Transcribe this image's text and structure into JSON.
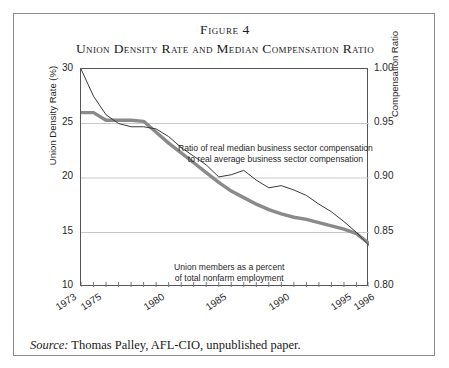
{
  "figure": {
    "number": "Figure 4",
    "title": "Union Density Rate and Median Compensation Ratio"
  },
  "source": {
    "label": "Source:",
    "text": " Thomas Palley, AFL-CIO, unpublished paper."
  },
  "chart_data": {
    "type": "line",
    "title": "Union Density Rate and Median Compensation Ratio",
    "xlabel": "",
    "ylabel": "Union Density Rate (%)",
    "y2label": "Compensation Ratio",
    "xlim": [
      1973,
      1996
    ],
    "ylim": [
      10,
      30
    ],
    "y2lim": [
      0.8,
      1.0
    ],
    "grid": true,
    "grid_axis": "y",
    "legend": "none",
    "x_ticks_major": [
      "1973",
      "1975",
      "1980",
      "1985",
      "1990",
      "1995",
      "1996"
    ],
    "x_ticks_major_values": [
      1973,
      1975,
      1980,
      1985,
      1990,
      1995,
      1996
    ],
    "x_ticks_minor_step": 1,
    "y_ticks": [
      "10",
      "15",
      "20",
      "25",
      "30"
    ],
    "y_tick_values": [
      10,
      15,
      20,
      25,
      30
    ],
    "y2_ticks": [
      "0.80",
      "0.85",
      "0.90",
      "0.95",
      "1.00"
    ],
    "y2_tick_values": [
      0.8,
      0.85,
      0.9,
      0.95,
      1.0
    ],
    "x": [
      1973,
      1974,
      1975,
      1976,
      1977,
      1978,
      1979,
      1980,
      1981,
      1982,
      1983,
      1984,
      1985,
      1986,
      1987,
      1988,
      1989,
      1990,
      1991,
      1992,
      1993,
      1994,
      1995,
      1996
    ],
    "series": [
      {
        "name": "Union members as a percent of total nonfarm employment",
        "axis": "left",
        "units": "percent",
        "color": "#8a8a8a",
        "line_width": 3.4,
        "annotation": "Union members as a percent\nof total nonfarm employment",
        "values": [
          26.0,
          26.0,
          25.3,
          25.3,
          25.3,
          25.2,
          24.2,
          23.2,
          22.3,
          21.4,
          20.5,
          19.6,
          18.8,
          18.2,
          17.6,
          17.1,
          16.7,
          16.4,
          16.2,
          15.9,
          15.6,
          15.3,
          14.9,
          14.0
        ]
      },
      {
        "name": "Ratio of real median business sector compensation to real average business sector compensation",
        "axis": "right",
        "units": "ratio",
        "color": "#3a3a3a",
        "line_width": 1.0,
        "annotation": "Ratio of real median business sector compensation\nto real average business sector compensation",
        "values": [
          1.0,
          0.975,
          0.958,
          0.95,
          0.947,
          0.947,
          0.945,
          0.938,
          0.928,
          0.92,
          0.912,
          0.901,
          0.903,
          0.907,
          0.898,
          0.891,
          0.893,
          0.889,
          0.884,
          0.876,
          0.869,
          0.86,
          0.85,
          0.838
        ]
      }
    ],
    "annotations": [
      {
        "name": "ratio-annotation",
        "lines": [
          "Ratio of real median business sector compensation",
          "to real average business sector compensation"
        ]
      },
      {
        "name": "union-annotation",
        "lines": [
          "Union members as a percent",
          "of total nonfarm employment"
        ]
      }
    ]
  }
}
